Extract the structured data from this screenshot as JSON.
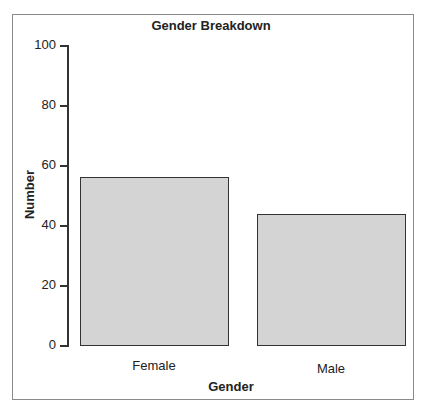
{
  "chart_data": {
    "type": "bar",
    "title": "Gender Breakdown",
    "categories": [
      "Female",
      "Male"
    ],
    "values": [
      56,
      44
    ],
    "xlabel": "Gender",
    "ylabel": "Number",
    "ylim": [
      0,
      100
    ],
    "yticks": [
      0,
      20,
      40,
      60,
      80,
      100
    ],
    "grid": false,
    "legend": null,
    "bar_color": "#d4d4d4"
  },
  "labels": {
    "title": "Gender Breakdown",
    "xlabel": "Gender",
    "ylabel": "Number",
    "yticks": [
      "0",
      "20",
      "40",
      "60",
      "80",
      "100"
    ],
    "cat0": "Female",
    "cat1": "Male"
  }
}
